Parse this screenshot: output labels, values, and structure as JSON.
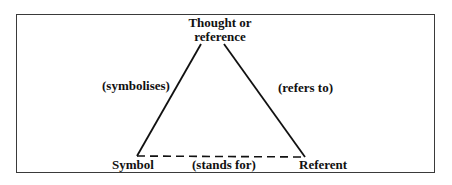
{
  "diagram": {
    "type": "semiotic-triangle",
    "nodes": {
      "apex": {
        "line1": "Thought or",
        "line2": "reference"
      },
      "bottom_left": {
        "label": "Symbol"
      },
      "bottom_right": {
        "label": "Referent"
      }
    },
    "edges": {
      "left": {
        "label": "(symbolises)",
        "style": "solid"
      },
      "right": {
        "label": "(refers to)",
        "style": "solid"
      },
      "bottom": {
        "label": "(stands for)",
        "style": "dashed"
      }
    },
    "colors": {
      "line": "#111111",
      "frame": "#3a3a3a",
      "background": "#ffffff"
    }
  }
}
